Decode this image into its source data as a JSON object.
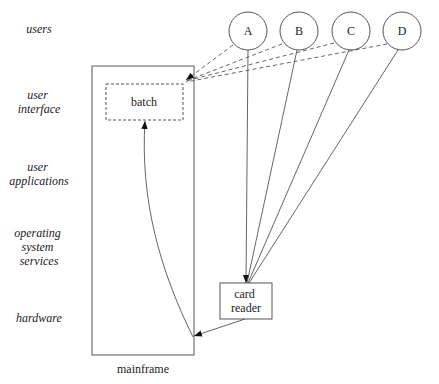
{
  "layers": [
    {
      "id": "users",
      "lines": [
        "users"
      ]
    },
    {
      "id": "user-interface",
      "lines": [
        "user",
        "interface"
      ]
    },
    {
      "id": "user-applications",
      "lines": [
        "user",
        "applications"
      ]
    },
    {
      "id": "operating-system-services",
      "lines": [
        "operating",
        "system",
        "services"
      ]
    },
    {
      "id": "hardware",
      "lines": [
        "hardware"
      ]
    }
  ],
  "nodes": {
    "mainframe": {
      "label": "mainframe"
    },
    "batch": {
      "label": "batch"
    },
    "card_reader": {
      "lines": [
        "card",
        "reader"
      ]
    },
    "users": [
      {
        "label": "A"
      },
      {
        "label": "B"
      },
      {
        "label": "C"
      },
      {
        "label": "D"
      }
    ]
  },
  "edges": [
    {
      "from": "A",
      "to": "batch",
      "style": "dashed"
    },
    {
      "from": "B",
      "to": "batch",
      "style": "dashed"
    },
    {
      "from": "C",
      "to": "batch",
      "style": "dashed"
    },
    {
      "from": "D",
      "to": "batch",
      "style": "dashed"
    },
    {
      "from": "A",
      "to": "card reader",
      "style": "solid"
    },
    {
      "from": "B",
      "to": "card reader",
      "style": "solid"
    },
    {
      "from": "C",
      "to": "card reader",
      "style": "solid"
    },
    {
      "from": "D",
      "to": "card reader",
      "style": "solid"
    },
    {
      "from": "card reader",
      "to": "mainframe",
      "style": "solid"
    },
    {
      "from": "mainframe",
      "to": "batch",
      "style": "solid-curve"
    }
  ]
}
